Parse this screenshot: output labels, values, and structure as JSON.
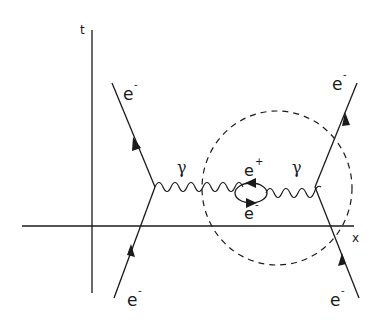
{
  "diagram": {
    "type": "feynman-diagram",
    "axes": {
      "time_label": "t",
      "space_label": "x"
    },
    "particles": {
      "incoming_left": "e",
      "incoming_left_sup": "-",
      "outgoing_left": "e",
      "outgoing_left_sup": "-",
      "incoming_right": "e",
      "incoming_right_sup": "-",
      "outgoing_right": "e",
      "outgoing_right_sup": "-",
      "photon_left": "γ",
      "photon_right": "γ",
      "loop_positron": "e",
      "loop_positron_sup": "+",
      "loop_electron": "e",
      "loop_electron_sup": "-"
    },
    "colors": {
      "ink": "#1a1a1a",
      "background": "#ffffff"
    }
  }
}
